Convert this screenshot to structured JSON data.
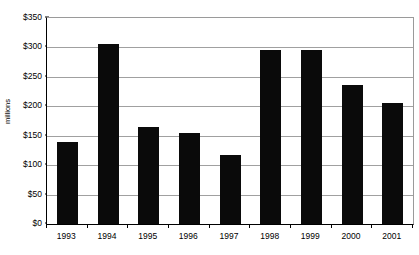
{
  "chart_data": {
    "type": "bar",
    "title": "",
    "subtitle": "",
    "xlabel": "",
    "ylabel": "millions",
    "categories": [
      "1993",
      "1994",
      "1995",
      "1996",
      "1997",
      "1998",
      "1999",
      "2000",
      "2001"
    ],
    "values": [
      140,
      305,
      165,
      155,
      118,
      295,
      296,
      236,
      205
    ],
    "series": [
      {
        "name": "",
        "values": [
          140,
          305,
          165,
          155,
          118,
          295,
          296,
          236,
          205
        ]
      }
    ],
    "ylim": [
      0,
      350
    ],
    "ytick_values": [
      0,
      50,
      100,
      150,
      200,
      250,
      300,
      350
    ],
    "ytick_labels": [
      "$0",
      "$50",
      "$100",
      "$150",
      "$200",
      "$250",
      "$300",
      "$350"
    ],
    "grid": true,
    "grid_axis": "y",
    "legend": false,
    "legend_position": "none",
    "bar_color": "#0a0a0a",
    "grid_color": "#a0a0a0",
    "axis_color": "#000000",
    "background_color": "#ffffff",
    "annotations": []
  }
}
